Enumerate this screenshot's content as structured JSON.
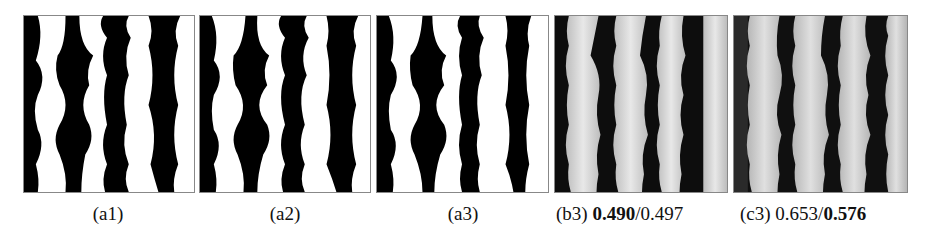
{
  "figure": {
    "panels": [
      {
        "id": "a1",
        "caption": "(a1)",
        "style": "binary"
      },
      {
        "id": "a2",
        "caption": "(a2)",
        "style": "binary"
      },
      {
        "id": "a3",
        "caption": "(a3)",
        "style": "binary"
      },
      {
        "id": "b3",
        "caption_label": "(b3)",
        "value_bold": "0.490",
        "separator": "/",
        "value_plain": "0.497",
        "style": "grayscale"
      },
      {
        "id": "c3",
        "caption_label": "(c3)",
        "value_plain": "0.653",
        "separator": "/",
        "value_bold": "0.576",
        "style": "grayscale"
      }
    ]
  }
}
